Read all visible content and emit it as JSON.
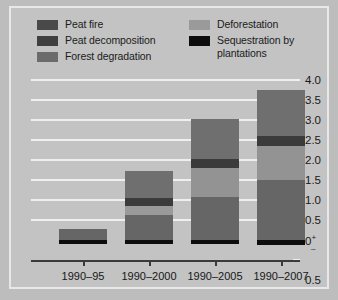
{
  "chart_data": {
    "type": "bar",
    "stacked": true,
    "title": "",
    "subtitle": "",
    "xlabel": "",
    "ylabel": "",
    "categories": [
      "1990–95",
      "1990–2000",
      "1990–2005",
      "1990–2007"
    ],
    "ylim": [
      -0.5,
      4.0
    ],
    "yticks": [
      "4.0",
      "3.5",
      "3.0",
      "2.5",
      "2.0",
      "1.5",
      "1.0",
      "0.5",
      "0",
      "0.5"
    ],
    "ytick_values": [
      4.0,
      3.5,
      3.0,
      2.5,
      2.0,
      1.5,
      1.0,
      0.5,
      0.0,
      -0.5
    ],
    "zero_sign_positive": "+",
    "zero_sign_negative": "–",
    "grid": true,
    "legend_position": "top",
    "series": [
      {
        "name": "Peat fire",
        "color": "#494949",
        "values": [
          0.0,
          0.12,
          0.22,
          0.26
        ]
      },
      {
        "name": "Peat decomposition",
        "color": "#3b3b3b",
        "values": [
          0.0,
          0.0,
          0.0,
          0.0
        ]
      },
      {
        "name": "Forest degradation",
        "color": "#6d6d6d",
        "values": [
          0.28,
          0.62,
          1.04,
          1.38
        ]
      },
      {
        "name": "Deforestation",
        "color": "#9a9a9a",
        "values": [
          0.0,
          0.22,
          0.55,
          0.85
        ]
      },
      {
        "name": "Sequestration by plantations",
        "color": "#0d0d0d",
        "values": [
          -0.09,
          -0.09,
          -0.1,
          -0.12
        ]
      }
    ],
    "bars": [
      {
        "category": "1990–95",
        "total_positive": 0.28,
        "segments": [
          {
            "series": "Sequestration by plantations",
            "from": -0.09,
            "to": 0.0,
            "color": "#0d0d0d"
          },
          {
            "series": "Forest degradation",
            "from": 0.0,
            "to": 0.28,
            "color": "#666666"
          }
        ]
      },
      {
        "category": "1990–2000",
        "total_positive": 1.72,
        "segments": [
          {
            "series": "Sequestration by plantations",
            "from": -0.09,
            "to": 0.0,
            "color": "#0d0d0d"
          },
          {
            "series": "Forest degradation",
            "from": 0.0,
            "to": 0.62,
            "color": "#666666"
          },
          {
            "series": "Deforestation",
            "from": 0.62,
            "to": 0.86,
            "color": "#9a9a9a"
          },
          {
            "series": "Peat decomposition",
            "from": 0.86,
            "to": 1.05,
            "color": "#3b3b3b"
          },
          {
            "series": "Peat fire",
            "from": 1.05,
            "to": 1.72,
            "color": "#6f6f6f"
          }
        ]
      },
      {
        "category": "1990–2005",
        "total_positive": 3.02,
        "segments": [
          {
            "series": "Sequestration by plantations",
            "from": -0.1,
            "to": 0.0,
            "color": "#0d0d0d"
          },
          {
            "series": "Forest degradation",
            "from": 0.0,
            "to": 1.08,
            "color": "#666666"
          },
          {
            "series": "Deforestation",
            "from": 1.08,
            "to": 1.8,
            "color": "#939393"
          },
          {
            "series": "Peat decomposition",
            "from": 1.8,
            "to": 2.02,
            "color": "#3b3b3b"
          },
          {
            "series": "Peat fire",
            "from": 2.02,
            "to": 3.02,
            "color": "#6f6f6f"
          }
        ]
      },
      {
        "category": "1990–2007",
        "total_positive": 3.75,
        "segments": [
          {
            "series": "Sequestration by plantations",
            "from": -0.12,
            "to": 0.0,
            "color": "#0d0d0d"
          },
          {
            "series": "Forest degradation",
            "from": 0.0,
            "to": 1.5,
            "color": "#666666"
          },
          {
            "series": "Deforestation",
            "from": 1.5,
            "to": 2.34,
            "color": "#939393"
          },
          {
            "series": "Peat decomposition",
            "from": 2.34,
            "to": 2.6,
            "color": "#3b3b3b"
          },
          {
            "series": "Peat fire",
            "from": 2.6,
            "to": 3.75,
            "color": "#6f6f6f"
          }
        ]
      }
    ]
  },
  "legend": {
    "left_column": [
      {
        "label": "Peat fire",
        "color": "#494949",
        "swatch": "legend-swatch-peat-fire"
      },
      {
        "label": "Peat decomposition",
        "color": "#3f3f3f",
        "swatch": "legend-swatch-peat-decomposition"
      },
      {
        "label": "Forest degradation",
        "color": "#6b6b6b",
        "swatch": "legend-swatch-forest-degradation"
      }
    ],
    "right_column": [
      {
        "label": "Deforestation",
        "color": "#9a9a9a",
        "swatch": "legend-swatch-deforestation"
      },
      {
        "label": "Sequestration by\nplantations",
        "color": "#0d0d0d",
        "swatch": "legend-swatch-sequestration"
      }
    ]
  },
  "axes": {
    "y_labels": [
      "4.0",
      "3.5",
      "3.0",
      "2.5",
      "2.0",
      "1.5",
      "1.0",
      "0.5"
    ],
    "zero_label": "0",
    "below_zero_label": "0.5",
    "x_labels": [
      "1990–95",
      "1990–2000",
      "1990–2005",
      "1990–2007"
    ]
  },
  "colors": {
    "background": "#c3c3c3",
    "gridline": "#efefef",
    "axis": "#3a3a3a",
    "text": "#181818"
  }
}
